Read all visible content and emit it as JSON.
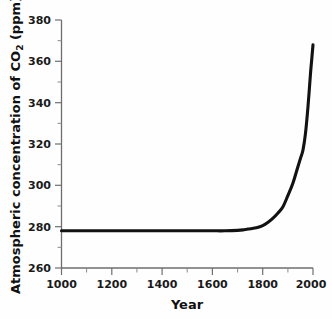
{
  "chart_data": {
    "type": "line",
    "title": "",
    "subtitle": "",
    "xlabel": "Year",
    "ylabel": "Atmospheric concentration of CO",
    "ylabel_subscript": "2",
    "ylabel_units": " (ppm)",
    "ylabel_full": "Atmospheric concentration of CO2 (ppm)",
    "xlim": [
      1000,
      2000
    ],
    "ylim": [
      260,
      380
    ],
    "grid": false,
    "legend": null,
    "x_ticks": [
      1000,
      1200,
      1400,
      1600,
      1800,
      2000
    ],
    "x_tick_labels": [
      "1000",
      "1200",
      "1400",
      "1600",
      "1800",
      "2000"
    ],
    "x_minor_ticks": [
      1100,
      1300,
      1500,
      1700,
      1900
    ],
    "y_ticks": [
      260,
      280,
      300,
      320,
      340,
      360,
      380
    ],
    "y_tick_labels": [
      "260",
      "280",
      "300",
      "320",
      "340",
      "360",
      "380"
    ],
    "y_minor_ticks": [
      270,
      290,
      310,
      330,
      350,
      370
    ],
    "series": [
      {
        "name": "Atmospheric CO2",
        "color": "#121212",
        "x": [
          1000,
          1050,
          1100,
          1150,
          1200,
          1250,
          1300,
          1350,
          1400,
          1450,
          1500,
          1550,
          1600,
          1650,
          1700,
          1725,
          1750,
          1775,
          1800,
          1820,
          1840,
          1860,
          1880,
          1900,
          1920,
          1940,
          1950,
          1960,
          1970,
          1980,
          1990,
          1995,
          2000
        ],
        "y": [
          278,
          278,
          278,
          278,
          278,
          278,
          278,
          278,
          278,
          278,
          278,
          278,
          278,
          278,
          278.2,
          278.5,
          279,
          279.5,
          280.5,
          282,
          284,
          286.5,
          289.5,
          295,
          301,
          309,
          313,
          317,
          325,
          338,
          354,
          361,
          368
        ]
      }
    ]
  },
  "axes": {
    "x_axis_name": "x-axis",
    "y_axis_name": "y-axis"
  }
}
